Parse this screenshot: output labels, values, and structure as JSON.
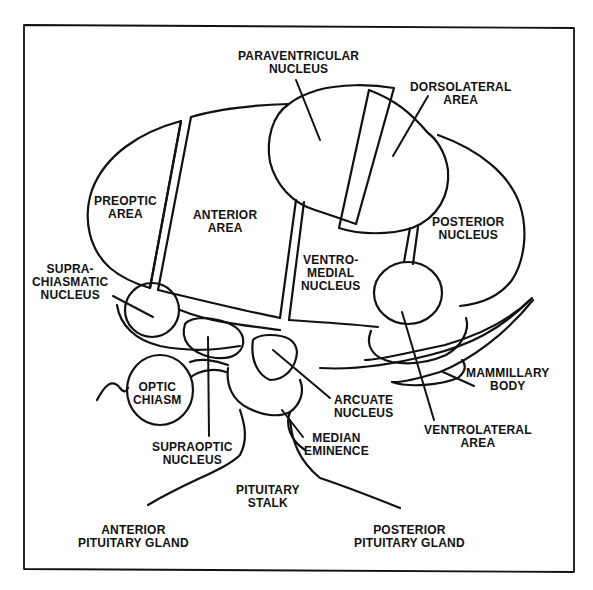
{
  "diagram": {
    "title": "",
    "stroke_color": "#111111",
    "background": "#ffffff",
    "labels": {
      "paraventricular": [
        "PARAVENTRICULAR",
        "NUCLEUS"
      ],
      "dorsolateral": [
        "DORSOLATERAL",
        "AREA"
      ],
      "preoptic": [
        "PREOPTIC",
        "AREA"
      ],
      "anterior": [
        "ANTERIOR",
        "AREA"
      ],
      "posterior": [
        "POSTERIOR",
        "NUCLEUS"
      ],
      "ventromedial": [
        "VENTRO-",
        "MEDIAL",
        "NUCLEUS"
      ],
      "suprachiasmatic": [
        "SUPRA-",
        "CHIASMATIC",
        "NUCLEUS"
      ],
      "optic_chiasm": [
        "OPTIC",
        "CHIASM"
      ],
      "supraoptic": [
        "SUPRAOPTIC",
        "NUCLEUS"
      ],
      "arcuate": [
        "ARCUATE",
        "NUCLEUS"
      ],
      "mammillary": [
        "MAMMILLARY",
        "BODY"
      ],
      "median_eminence": [
        "MEDIAN",
        "EMINENCE"
      ],
      "ventrolateral": [
        "VENTROLATERAL",
        "AREA"
      ],
      "pituitary_stalk": [
        "PITUITARY",
        "STALK"
      ],
      "anterior_pituitary": [
        "ANTERIOR",
        "PITUITARY GLAND"
      ],
      "posterior_pituitary": [
        "POSTERIOR",
        "PITUITARY GLAND"
      ]
    }
  }
}
